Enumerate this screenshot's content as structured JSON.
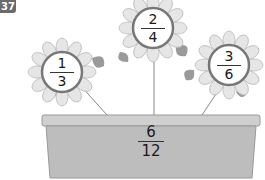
{
  "problem_number": "37",
  "flowers": [
    {
      "numerator": "1",
      "denominator": "3"
    },
    {
      "numerator": "2",
      "denominator": "4"
    },
    {
      "numerator": "3",
      "denominator": "6"
    }
  ],
  "pot": {
    "numerator": "6",
    "denominator": "12"
  },
  "colors": {
    "petal": "#e4e4e4",
    "leaf": "#9a9a9a",
    "pot": "#bdbdbd",
    "circle_ring": "#777777"
  }
}
